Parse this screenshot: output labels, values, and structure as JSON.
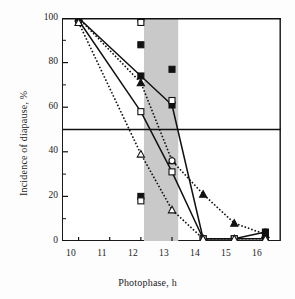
{
  "chart_data": {
    "type": "line",
    "title": "",
    "xlabel": "Photophase, h",
    "ylabel": "Incidence of diapause, %",
    "xlim": [
      9.5,
      16.5
    ],
    "ylim": [
      0,
      100
    ],
    "xticks": [
      10,
      11,
      12,
      13,
      14,
      15,
      16
    ],
    "yticks": [
      0,
      20,
      40,
      60,
      80,
      100
    ],
    "grid": false,
    "legend": "none",
    "annotations": [
      {
        "name": "critical-threshold-line",
        "type": "hline",
        "y": 50
      },
      {
        "name": "shaded-band",
        "type": "vspan",
        "x0": 12.1,
        "x1": 13.2,
        "color": "#c9c9c9"
      }
    ],
    "series": [
      {
        "name": "series-solid-filled-square",
        "marker": "filled-square",
        "line": "solid",
        "color": "#111111",
        "x": [
          10,
          12,
          13,
          14,
          15,
          16
        ],
        "values": [
          100,
          74,
          61,
          1,
          1,
          4
        ]
      },
      {
        "name": "series-solid-open-square",
        "marker": "open-square",
        "line": "solid",
        "color": "#111111",
        "x": [
          10,
          12,
          13,
          14,
          15,
          16
        ],
        "values": [
          99,
          58,
          31,
          1,
          1,
          1
        ]
      },
      {
        "name": "series-dotted-filled-triangle",
        "marker": "filled-triangle",
        "line": "dotted",
        "color": "#111111",
        "x": [
          10,
          12,
          13,
          14,
          15,
          16
        ],
        "values": [
          100,
          71,
          36,
          21,
          8,
          3
        ]
      },
      {
        "name": "series-dotted-open-triangle",
        "marker": "open-triangle",
        "line": "dotted",
        "color": "#111111",
        "x": [
          10,
          12,
          13,
          14,
          15,
          16
        ],
        "values": [
          98,
          39,
          14,
          1,
          1,
          1
        ]
      }
    ],
    "scatter_points": [
      {
        "name": "extra-point",
        "x": 12,
        "y": 100,
        "marker": "filled-square"
      },
      {
        "name": "extra-point",
        "x": 12,
        "y": 98,
        "marker": "open-square"
      },
      {
        "name": "extra-point",
        "x": 12,
        "y": 88,
        "marker": "filled-square"
      },
      {
        "name": "extra-point",
        "x": 12,
        "y": 20,
        "marker": "filled-square"
      },
      {
        "name": "extra-point",
        "x": 12,
        "y": 18,
        "marker": "open-square"
      },
      {
        "name": "extra-point",
        "x": 13,
        "y": 77,
        "marker": "filled-square"
      },
      {
        "name": "extra-point",
        "x": 13,
        "y": 63,
        "marker": "open-square"
      },
      {
        "name": "extra-point",
        "x": 13,
        "y": 36,
        "marker": "open-circle"
      },
      {
        "name": "extra-point",
        "x": 16,
        "y": 4,
        "marker": "filled-circle"
      }
    ]
  },
  "axes": {
    "y_title": "Incidence of diapause, %",
    "x_title": "Photophase, h",
    "x_tick_labels": [
      "10",
      "11",
      "12",
      "13",
      "14",
      "15",
      "16"
    ],
    "y_tick_labels": [
      "0",
      "20",
      "40",
      "60",
      "80",
      "100"
    ]
  },
  "colors": {
    "ink": "#111111",
    "band": "#c9c9c9",
    "background": "#ffffff"
  }
}
